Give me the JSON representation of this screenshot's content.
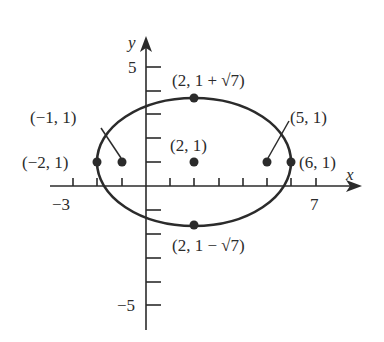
{
  "figure": {
    "colors": {
      "ink": "#2b2b2b",
      "background": "#ffffff"
    },
    "axes": {
      "x_label": "x",
      "y_label": "y",
      "x_tick_labels": {
        "min": "−3",
        "max": "7"
      },
      "y_tick_labels": {
        "max": "5",
        "min": "−5"
      },
      "x_range": [
        -4,
        9
      ],
      "y_range": [
        -6,
        6
      ]
    },
    "ellipse": {
      "center": [
        2,
        1
      ],
      "semi_major": 4,
      "semi_minor_label": "√7",
      "semi_minor": 2.6458
    },
    "points": [
      {
        "id": "vertex-left",
        "coords": [
          -2,
          1
        ],
        "label": "(−2, 1)"
      },
      {
        "id": "focus-left",
        "coords": [
          -1,
          1
        ],
        "label": "(−1, 1)"
      },
      {
        "id": "center",
        "coords": [
          2,
          1
        ],
        "label": "(2, 1)"
      },
      {
        "id": "focus-right",
        "coords": [
          5,
          1
        ],
        "label": "(5, 1)"
      },
      {
        "id": "vertex-right",
        "coords": [
          6,
          1
        ],
        "label": "(6, 1)"
      },
      {
        "id": "covertex-top",
        "coords": [
          2,
          3.6458
        ],
        "label": "(2, 1 + √7)"
      },
      {
        "id": "covertex-bottom",
        "coords": [
          2,
          -1.6458
        ],
        "label": "(2, 1 − √7)"
      }
    ]
  }
}
